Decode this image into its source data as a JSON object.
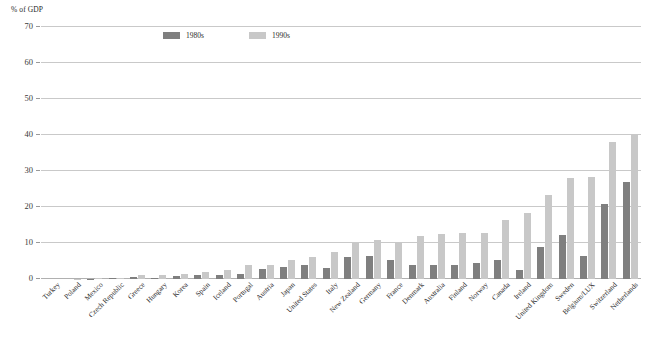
{
  "chart_data": {
    "type": "bar",
    "title": "",
    "subtitle": "",
    "xlabel": "",
    "ylabel": "% of GDP",
    "ylim": [
      0,
      70
    ],
    "yticks": [
      0,
      10,
      20,
      30,
      40,
      50,
      60,
      70
    ],
    "ytick_labels": [
      "0",
      "10",
      "20",
      "30",
      "40",
      "50",
      "60",
      "70"
    ],
    "grid": true,
    "legend_position": "top-left-inside",
    "orientation": "vertical",
    "grouping": "grouped",
    "categories": [
      "Turkey",
      "Poland",
      "Mexico",
      "Czech Republic",
      "Greece",
      "Hungary",
      "Korea",
      "Spain",
      "Iceland",
      "Portugal",
      "Austria",
      "Japan",
      "United States",
      "Italy",
      "New Zealand",
      "Germany",
      "France",
      "Denmark",
      "Australia",
      "Finland",
      "Norway",
      "Canada",
      "Ireland",
      "United Kingdom",
      "Sweden",
      "Belgium/LUX",
      "Switzerland",
      "Netherlands"
    ],
    "series": [
      {
        "name": "1980s",
        "color": "#7f7f7f",
        "values": [
          0.0,
          0.0,
          0.1,
          0.2,
          0.5,
          0.3,
          0.9,
          1.0,
          1.0,
          1.4,
          2.9,
          3.4,
          4.0,
          3.0,
          6.0,
          6.4,
          5.4,
          4.0,
          4.0,
          4.0,
          4.4,
          5.4,
          2.4,
          9.0,
          12.3,
          6.4,
          20.7,
          27.0
        ]
      },
      {
        "name": "1990s",
        "color": "#c8c8c8",
        "values": [
          0.0,
          0.1,
          0.2,
          0.3,
          1.0,
          1.0,
          1.4,
          1.9,
          2.4,
          3.9,
          3.9,
          5.4,
          6.0,
          7.4,
          10.0,
          10.9,
          10.4,
          12.0,
          12.4,
          12.9,
          12.9,
          16.5,
          18.4,
          23.4,
          28.0,
          28.4,
          38.0,
          40.4
        ]
      }
    ]
  },
  "legend": {
    "entries": [
      {
        "label": "1980s",
        "color": "#7f7f7f"
      },
      {
        "label": "1990s",
        "color": "#c8c8c8"
      }
    ]
  }
}
